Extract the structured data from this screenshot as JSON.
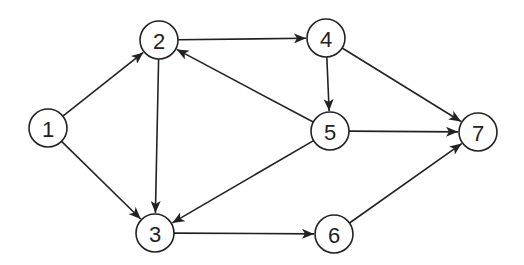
{
  "graph": {
    "type": "directed",
    "node_radius": 19,
    "colors": {
      "stroke": "#222222",
      "fill": "#ffffff",
      "background": "#ffffff"
    },
    "nodes": [
      {
        "id": "1",
        "label": "1",
        "x": 48,
        "y": 128
      },
      {
        "id": "2",
        "label": "2",
        "x": 159,
        "y": 40
      },
      {
        "id": "3",
        "label": "3",
        "x": 155,
        "y": 233
      },
      {
        "id": "4",
        "label": "4",
        "x": 326,
        "y": 38
      },
      {
        "id": "5",
        "label": "5",
        "x": 330,
        "y": 131
      },
      {
        "id": "6",
        "label": "6",
        "x": 334,
        "y": 234
      },
      {
        "id": "7",
        "label": "7",
        "x": 478,
        "y": 132
      }
    ],
    "edges": [
      {
        "from": "1",
        "to": "2"
      },
      {
        "from": "1",
        "to": "3"
      },
      {
        "from": "2",
        "to": "4"
      },
      {
        "from": "2",
        "to": "3"
      },
      {
        "from": "4",
        "to": "5"
      },
      {
        "from": "4",
        "to": "7"
      },
      {
        "from": "5",
        "to": "2"
      },
      {
        "from": "5",
        "to": "3"
      },
      {
        "from": "5",
        "to": "7"
      },
      {
        "from": "3",
        "to": "6"
      },
      {
        "from": "6",
        "to": "7"
      }
    ]
  }
}
